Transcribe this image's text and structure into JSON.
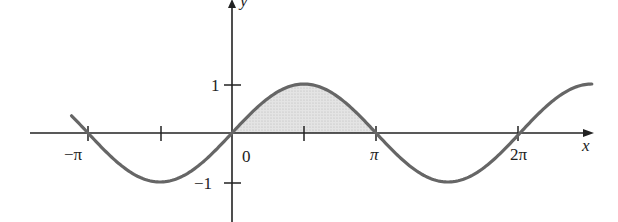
{
  "chart_data": {
    "type": "line",
    "title": "",
    "function": "y = sin(x)",
    "xlabel": "x",
    "ylabel": "y",
    "x_ticks": [
      {
        "value": -3.14159,
        "label": "−π"
      },
      {
        "value": -1.5708,
        "label": ""
      },
      {
        "value": 0,
        "label": "0"
      },
      {
        "value": 1.5708,
        "label": ""
      },
      {
        "value": 3.14159,
        "label": "π"
      },
      {
        "value": 6.28319,
        "label": "2π"
      }
    ],
    "y_ticks": [
      {
        "value": 1,
        "label": "1"
      },
      {
        "value": -1,
        "label": "−1"
      }
    ],
    "xlim": [
      -3.5,
      7.85
    ],
    "ylim": [
      -1,
      1
    ],
    "series": [
      {
        "name": "sin x",
        "x_range": [
          -3.5,
          7.85
        ],
        "color": "#666666"
      }
    ],
    "shaded_region": {
      "from": 0,
      "to": 3.14159,
      "between": "curve and x-axis",
      "color": "#d9d9d9"
    },
    "grid": false,
    "legend": null
  },
  "labels": {
    "x_axis": "x",
    "y_axis": "y",
    "origin": "0",
    "neg_pi": "−π",
    "pi": "π",
    "two_pi": "2π",
    "one": "1",
    "neg_one": "−1"
  }
}
